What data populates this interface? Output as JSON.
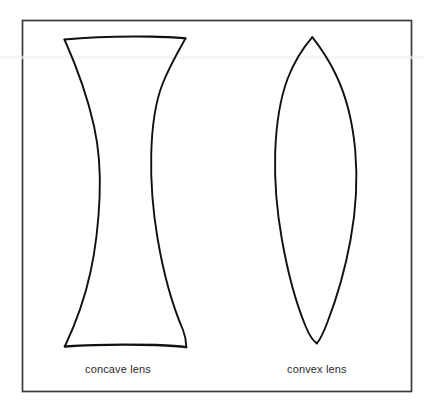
{
  "figure": {
    "background_color": "#ffffff",
    "border_color": "#3a3a3a",
    "ink_color": "#111111",
    "label_color": "#2a2a2a",
    "frame": {
      "x": 22,
      "y": 20,
      "width": 390,
      "height": 372,
      "stroke_width": 1.6
    }
  },
  "diagram_data": {
    "type": "line-drawing",
    "style": "hand-drawn ink outline, unfilled",
    "shapes": [
      {
        "id": "concave-lens",
        "name": "concave lens",
        "kind": "biconcave",
        "label": "concave lens",
        "description": "Hourglass outline: flat top and bottom edges with two inward-curving (concave) vertical sides",
        "top_edge": {
          "y": 38,
          "x_left": 64,
          "x_right": 185
        },
        "bottom_edge": {
          "y": 347,
          "x_left": 64,
          "x_right": 186
        },
        "waist": {
          "y": 195,
          "x_left": 99,
          "x_right": 151
        },
        "height": 309,
        "max_width": 122,
        "min_width": 52,
        "label_position": {
          "x": 85,
          "y": 370
        }
      },
      {
        "id": "convex-lens",
        "name": "convex lens",
        "kind": "biconvex",
        "label": "convex lens",
        "description": "Lens/vesica outline: two outward-curving (convex) arcs meeting at sharp top and bottom points",
        "top_point": {
          "x": 312,
          "y": 37
        },
        "bottom_point": {
          "x": 317,
          "y": 343
        },
        "widest": {
          "y": 195,
          "x_left": 275,
          "x_right": 356
        },
        "height": 306,
        "max_width": 81,
        "label_position": {
          "x": 287,
          "y": 370
        }
      }
    ],
    "labels": [
      "concave lens",
      "convex lens"
    ]
  },
  "labels": {
    "concave": "concave lens",
    "convex": "convex lens"
  }
}
